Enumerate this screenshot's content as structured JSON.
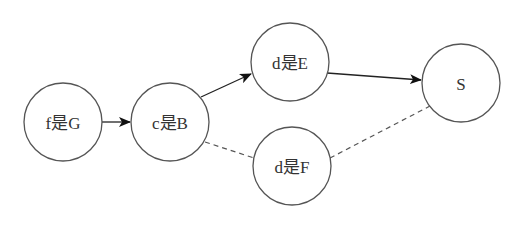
{
  "diagram": {
    "nodes": [
      {
        "id": "fG",
        "label": "f是G",
        "cx": 63,
        "cy": 122,
        "r": 39
      },
      {
        "id": "cB",
        "label": "c是B",
        "cx": 170,
        "cy": 122,
        "r": 39
      },
      {
        "id": "dE",
        "label": "d是E",
        "cx": 290,
        "cy": 62,
        "r": 39
      },
      {
        "id": "dF",
        "label": "d是F",
        "cx": 292,
        "cy": 166,
        "r": 39
      },
      {
        "id": "S",
        "label": "S",
        "cx": 461,
        "cy": 83,
        "r": 39
      }
    ],
    "edges": [
      {
        "from": "fG",
        "to": "cB",
        "style": "solid",
        "arrow": true
      },
      {
        "from": "cB",
        "to": "dE",
        "style": "solid",
        "arrow": true
      },
      {
        "from": "dE",
        "to": "S",
        "style": "solid",
        "arrow": true
      },
      {
        "from": "cB",
        "to": "dF",
        "style": "dashed",
        "arrow": false
      },
      {
        "from": "dF",
        "to": "S",
        "style": "dashed",
        "arrow": false
      }
    ],
    "colors": {
      "node_stroke": "#555555",
      "edge": "#222222",
      "text": "#333333",
      "background": "#ffffff"
    }
  }
}
